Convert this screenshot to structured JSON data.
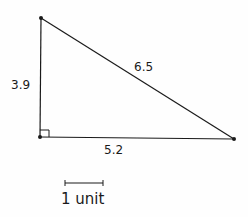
{
  "diagram": {
    "type": "right-triangle",
    "vertices": {
      "top": {
        "x": 41,
        "y": 18
      },
      "bottom_left": {
        "x": 40,
        "y": 137
      },
      "bottom_right": {
        "x": 234,
        "y": 139
      }
    },
    "sides": {
      "vertical": {
        "label": "3.9"
      },
      "hypotenuse": {
        "label": "6.5"
      },
      "base": {
        "label": "5.2"
      }
    },
    "right_angle_marker": true,
    "scale_bar": {
      "label": "1 unit"
    },
    "stroke_color": "#1a1a1a"
  }
}
